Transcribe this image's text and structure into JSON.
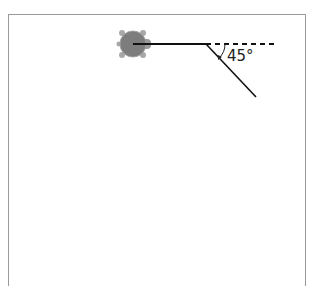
{
  "diagram": {
    "type": "turtle-graphics",
    "angle_label": "45°",
    "turtle": {
      "x": 133,
      "y": 44,
      "heading": "east"
    },
    "path": [
      {
        "from": [
          133,
          44
        ],
        "to": [
          206,
          44
        ],
        "style": "solid"
      },
      {
        "from": [
          206,
          44
        ],
        "to": [
          278,
          44
        ],
        "style": "dashed"
      },
      {
        "from": [
          206,
          44
        ],
        "to": [
          256,
          97
        ],
        "style": "solid"
      }
    ],
    "colors": {
      "line": "#111111",
      "turtle_shell": "#7a7a7a",
      "turtle_limbs": "#a0a0a0",
      "border": "#9a9a9a"
    }
  }
}
